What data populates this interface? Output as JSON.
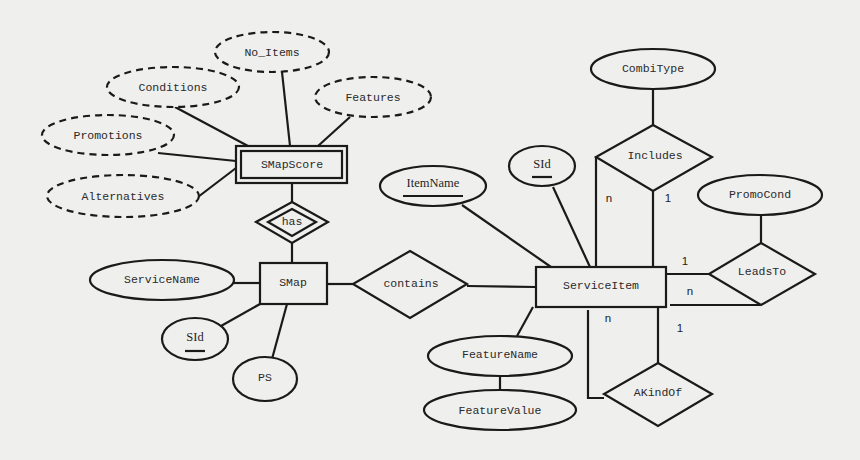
{
  "diagram": {
    "type": "entity-relationship",
    "entities": {
      "smapscore": {
        "label": "SMapScore",
        "kind": "weak-entity"
      },
      "smap": {
        "label": "SMap",
        "kind": "entity"
      },
      "serviceitem": {
        "label": "ServiceItem",
        "kind": "entity"
      }
    },
    "relationships": {
      "has": {
        "label": "has",
        "kind": "identifying-relationship"
      },
      "contains": {
        "label": "contains"
      },
      "includes": {
        "label": "Includes"
      },
      "leadsto": {
        "label": "LeadsTo"
      },
      "akindof": {
        "label": "AKindOf"
      }
    },
    "attributes": {
      "no_items": {
        "label": "No_Items",
        "kind": "derived"
      },
      "conditions": {
        "label": "Conditions",
        "kind": "derived"
      },
      "features": {
        "label": "Features",
        "kind": "derived"
      },
      "promotions": {
        "label": "Promotions",
        "kind": "derived"
      },
      "alternatives": {
        "label": "Alternatives",
        "kind": "derived"
      },
      "servicename": {
        "label": "ServiceName"
      },
      "smap_sid": {
        "label": "SId",
        "kind": "key"
      },
      "ps": {
        "label": "PS"
      },
      "itemname": {
        "label": "ItemName",
        "kind": "key"
      },
      "serviceitem_sid": {
        "label": "SId",
        "kind": "key"
      },
      "combitype": {
        "label": "CombiType"
      },
      "promocond": {
        "label": "PromoCond"
      },
      "featurename": {
        "label": "FeatureName"
      },
      "featurevalue": {
        "label": "FeatureValue"
      }
    },
    "cardinalities": {
      "includes_n": "n",
      "includes_1": "1",
      "leadsto_1": "1",
      "leadsto_n": "n",
      "akindof_n": "n",
      "akindof_1": "1"
    }
  }
}
